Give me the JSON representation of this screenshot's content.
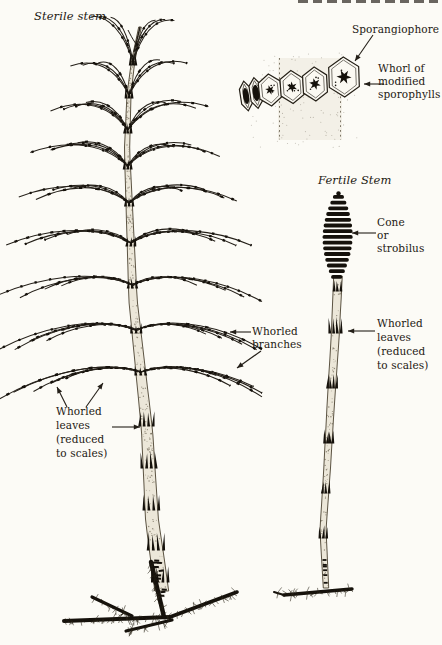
{
  "page": {
    "paper_color": "#fcfbf6",
    "ink_color": "#221e18",
    "clipped_header_fragment": "illegible page-header text cut off at top edge"
  },
  "figure": {
    "sterile": {
      "title": "Sterile stem",
      "labels": {
        "whorled_branches": "Whorled\nbranches",
        "whorled_leaves": "Whorled\nleaves\n(reduced\nto scales)"
      }
    },
    "inset": {
      "labels": {
        "sporangiophore": "Sporangiophore",
        "whorl_modified": "Whorl of\nmodified\nsporophylls"
      }
    },
    "fertile": {
      "title": "Fertile Stem",
      "labels": {
        "cone": "Cone\nor\nstrobilus",
        "whorled_leaves": "Whorled\nleaves\n(reduced\nto scales)"
      }
    }
  }
}
